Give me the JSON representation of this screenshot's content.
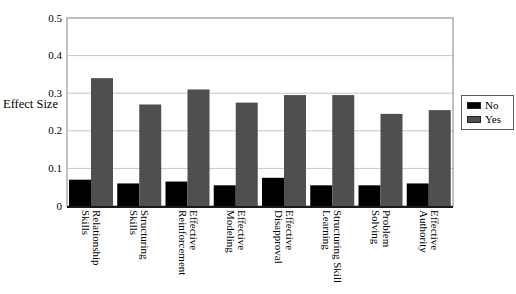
{
  "chart_data": {
    "type": "bar",
    "title": "",
    "xlabel": "",
    "ylabel": "Effect Size",
    "ylim": [
      0,
      0.5
    ],
    "ytick_step": 0.1,
    "grid": true,
    "legend_position": "right",
    "categories": [
      "Relationship\nSkills",
      "Structuring\nSkills",
      "Effective\nReinforcement",
      "Effective\nModeling",
      "Effective\nDisapproval",
      "Structuring Skill\nLearning",
      "Problem\nSolving",
      "Effective\nAuthority"
    ],
    "series": [
      {
        "name": "No",
        "color": "#000000",
        "values": [
          0.07,
          0.06,
          0.065,
          0.055,
          0.075,
          0.055,
          0.055,
          0.06
        ]
      },
      {
        "name": "Yes",
        "color": "#4f4f4f",
        "values": [
          0.34,
          0.27,
          0.31,
          0.275,
          0.295,
          0.295,
          0.245,
          0.255
        ]
      }
    ],
    "colors": {
      "background": "#ffffff",
      "gridline": "#c6c6c6",
      "plot_border": "#848484",
      "axis_bottom": "#1a1a1a",
      "text": "#000000"
    }
  }
}
